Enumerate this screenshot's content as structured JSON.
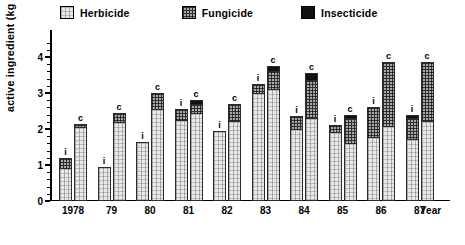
{
  "legend": {
    "items": [
      {
        "label": "Herbicide",
        "fill": "herbicide",
        "color": "#e9e9e9"
      },
      {
        "label": "Fungicide",
        "fill": "fungicide",
        "color": "#a8a8a8"
      },
      {
        "label": "Insecticide",
        "fill": "insecticide",
        "color": "#101010"
      }
    ]
  },
  "axes": {
    "ylabel": "active ingredient  (kg / ha)",
    "xlabel": "Year",
    "yticks": [
      "0",
      "1",
      "2",
      "3",
      "4"
    ],
    "ymin": 0,
    "ymax": 4.6
  },
  "chart_data": {
    "type": "bar",
    "title": "",
    "subtype": "grouped-stacked",
    "xlabel": "Year",
    "ylabel": "active ingredient (kg / ha)",
    "ylim": [
      0,
      4.6
    ],
    "yticks": [
      0,
      1,
      2,
      3,
      4
    ],
    "grid": false,
    "legend_position": "top",
    "legend": [
      "Herbicide",
      "Fungicide",
      "Insecticide"
    ],
    "categories": [
      "1978",
      "79",
      "80",
      "81",
      "82",
      "83",
      "84",
      "85",
      "86",
      "87"
    ],
    "bar_labels": [
      "i",
      "c"
    ],
    "bar_label_meaning": {
      "i": "i",
      "c": "c"
    },
    "groups": [
      {
        "category": "1978",
        "bars": [
          {
            "label": "i",
            "herbicide": 0.9,
            "fungicide": 0.3,
            "insecticide": 0.0,
            "total": 1.2
          },
          {
            "label": "c",
            "herbicide": 2.05,
            "fungicide": 0.1,
            "insecticide": 0.0,
            "total": 2.15
          }
        ]
      },
      {
        "category": "79",
        "bars": [
          {
            "label": "i",
            "herbicide": 0.95,
            "fungicide": 0.0,
            "insecticide": 0.0,
            "total": 0.95
          },
          {
            "label": "c",
            "herbicide": 2.2,
            "fungicide": 0.25,
            "insecticide": 0.0,
            "total": 2.45
          }
        ]
      },
      {
        "category": "80",
        "bars": [
          {
            "label": "i",
            "herbicide": 1.65,
            "fungicide": 0.0,
            "insecticide": 0.0,
            "total": 1.65
          },
          {
            "label": "c",
            "herbicide": 2.55,
            "fungicide": 0.45,
            "insecticide": 0.0,
            "total": 3.0
          }
        ]
      },
      {
        "category": "81",
        "bars": [
          {
            "label": "i",
            "herbicide": 2.25,
            "fungicide": 0.3,
            "insecticide": 0.0,
            "total": 2.55
          },
          {
            "label": "c",
            "herbicide": 2.45,
            "fungicide": 0.25,
            "insecticide": 0.1,
            "total": 2.8
          }
        ]
      },
      {
        "category": "82",
        "bars": [
          {
            "label": "i",
            "herbicide": 1.95,
            "fungicide": 0.0,
            "insecticide": 0.0,
            "total": 1.95
          },
          {
            "label": "c",
            "herbicide": 2.2,
            "fungicide": 0.5,
            "insecticide": 0.0,
            "total": 2.7
          }
        ]
      },
      {
        "category": "83",
        "bars": [
          {
            "label": "i",
            "herbicide": 3.0,
            "fungicide": 0.25,
            "insecticide": 0.0,
            "total": 3.25
          },
          {
            "label": "c",
            "herbicide": 3.1,
            "fungicide": 0.5,
            "insecticide": 0.15,
            "total": 3.75
          }
        ]
      },
      {
        "category": "84",
        "bars": [
          {
            "label": "i",
            "herbicide": 2.0,
            "fungicide": 0.35,
            "insecticide": 0.0,
            "total": 2.35
          },
          {
            "label": "c",
            "herbicide": 2.3,
            "fungicide": 1.05,
            "insecticide": 0.2,
            "total": 3.55
          }
        ]
      },
      {
        "category": "85",
        "bars": [
          {
            "label": "i",
            "herbicide": 1.9,
            "fungicide": 0.2,
            "insecticide": 0.0,
            "total": 2.1
          },
          {
            "label": "c",
            "herbicide": 1.6,
            "fungicide": 0.7,
            "insecticide": 0.1,
            "total": 2.4
          }
        ]
      },
      {
        "category": "86",
        "bars": [
          {
            "label": "i",
            "herbicide": 1.75,
            "fungicide": 0.85,
            "insecticide": 0.0,
            "total": 2.6
          },
          {
            "label": "c",
            "herbicide": 2.05,
            "fungicide": 1.8,
            "insecticide": 0.0,
            "total": 3.85
          }
        ]
      },
      {
        "category": "87",
        "bars": [
          {
            "label": "i",
            "herbicide": 1.7,
            "fungicide": 0.6,
            "insecticide": 0.1,
            "total": 2.4
          },
          {
            "label": "c",
            "herbicide": 2.2,
            "fungicide": 1.65,
            "insecticide": 0.0,
            "total": 3.85
          }
        ]
      }
    ]
  }
}
